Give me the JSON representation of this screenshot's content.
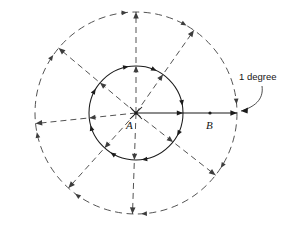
{
  "figure": {
    "name": "concentric-circles-angular-diagram",
    "background_color": "#ffffff",
    "width": 282,
    "height": 226,
    "center": {
      "x": 136,
      "y": 113
    },
    "points": [
      {
        "id": "A",
        "label": "A",
        "x": 136,
        "y": 113,
        "label_x": 126,
        "label_y": 129,
        "role": "center"
      },
      {
        "id": "B",
        "label": "B",
        "x": 210,
        "y": 113,
        "label_x": 206,
        "label_y": 129,
        "role": "midpoint-on-radius"
      }
    ],
    "circles": [
      {
        "id": "inner",
        "radius": 47,
        "style": "solid",
        "color": "#1b1b1b"
      },
      {
        "id": "outer",
        "radius": 101,
        "style": "dashed",
        "color": "#4a4a4a"
      }
    ],
    "rays": [
      {
        "id": "ray-0",
        "angle_deg": 0,
        "style": "solid",
        "color": "#1b1b1b"
      },
      {
        "id": "ray-55",
        "angle_deg": 55,
        "style": "dashed",
        "color": "#4a4a4a"
      },
      {
        "id": "ray-90",
        "angle_deg": 90,
        "style": "dashed",
        "color": "#4a4a4a"
      },
      {
        "id": "ray-140",
        "angle_deg": 140,
        "style": "dashed",
        "color": "#4a4a4a"
      },
      {
        "id": "ray-186",
        "angle_deg": 186,
        "style": "dashed",
        "color": "#4a4a4a"
      },
      {
        "id": "ray-228",
        "angle_deg": 228,
        "style": "dashed",
        "color": "#4a4a4a"
      },
      {
        "id": "ray-268",
        "angle_deg": 268,
        "style": "dashed",
        "color": "#4a4a4a"
      },
      {
        "id": "ray-322",
        "angle_deg": 322,
        "style": "dashed",
        "color": "#4a4a4a"
      }
    ],
    "annotation": {
      "text": "1 degree",
      "text_x": 239,
      "text_y": 80,
      "leader_from": {
        "x": 262,
        "y": 86
      },
      "leader_to": {
        "x": 240,
        "y": 110
      },
      "color": "#151515"
    }
  },
  "chart_data": {
    "type": "diagram",
    "title": "",
    "center_label": "A",
    "secondary_label": "B",
    "annotation_label": "1 degree",
    "inner_circle_radius_px": 47,
    "outer_circle_radius_px": 101,
    "ray_angles_deg": [
      0,
      55,
      90,
      140,
      186,
      228,
      268,
      322
    ],
    "legend": []
  }
}
